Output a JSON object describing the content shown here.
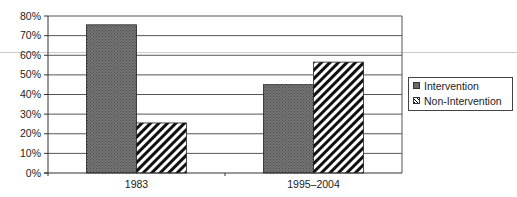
{
  "chart_data": {
    "type": "bar",
    "title": "",
    "xlabel": "",
    "ylabel": "",
    "categories": [
      "1983",
      "1995–2004"
    ],
    "series": [
      {
        "name": "Intervention",
        "values": [
          75.5,
          45
        ],
        "fill": "dotted-gray"
      },
      {
        "name": "Non-Intervention",
        "values": [
          25.5,
          56.5
        ],
        "fill": "diagonal-hatch"
      }
    ],
    "ylim": [
      0,
      80
    ],
    "yticks": [
      "0%",
      "10%",
      "20%",
      "30%",
      "40%",
      "50%",
      "60%",
      "70%",
      "80%"
    ],
    "grid": true,
    "legend_position": "right"
  },
  "legend": {
    "items": [
      {
        "label": "Intervention"
      },
      {
        "label": "Non-Intervention"
      }
    ]
  },
  "colors": {
    "intervention": "#6a6a6a",
    "gridline": "#555555",
    "axis": "#333333"
  }
}
